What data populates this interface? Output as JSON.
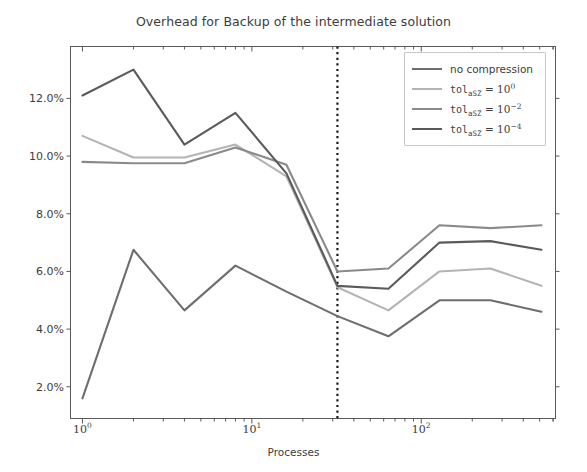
{
  "chart_data": {
    "type": "line",
    "title": "Overhead for Backup of the intermediate solution",
    "xlabel": "Processes",
    "ylabel": "",
    "xscale": "log",
    "yscale": "linear",
    "xlim": [
      0.85,
      620
    ],
    "ylim": [
      0.009,
      0.138
    ],
    "grid": false,
    "legend_position": "upper right",
    "xtick_labels": [
      "10^0",
      "10^1",
      "10^2"
    ],
    "xtick_values": [
      1,
      10,
      100
    ],
    "ytick_labels": [
      "2.0%",
      "4.0%",
      "6.0%",
      "8.0%",
      "10.0%",
      "12.0%"
    ],
    "ytick_values": [
      2.0,
      4.0,
      6.0,
      8.0,
      10.0,
      12.0
    ],
    "x": [
      1,
      2,
      4,
      8,
      16,
      32,
      64,
      128,
      256,
      512
    ],
    "annotations": [
      {
        "type": "vline",
        "x": 32,
        "style": "dotted",
        "color": "#1a1a1a"
      }
    ],
    "series": [
      {
        "name": "no compression",
        "label_plain": "no compression",
        "color": "#6e6e6e",
        "values": [
          1.6,
          6.75,
          4.65,
          6.2,
          5.3,
          4.45,
          3.75,
          5.0,
          5.0,
          4.6
        ]
      },
      {
        "name": "tol_aSZ = 10^0",
        "label_prefix": "tol",
        "label_sub": "aSZ",
        "label_eq": "=",
        "label_base": "10",
        "label_exp": "0",
        "color": "#b4b4b4",
        "values": [
          10.7,
          9.95,
          9.95,
          10.4,
          9.3,
          5.45,
          4.65,
          6.0,
          6.1,
          5.5
        ]
      },
      {
        "name": "tol_aSZ = 10^-2",
        "label_prefix": "tol",
        "label_sub": "aSZ",
        "label_eq": "=",
        "label_base": "10",
        "label_exp": "−2",
        "color": "#8a8a8a",
        "values": [
          9.8,
          9.75,
          9.75,
          10.3,
          9.7,
          6.0,
          6.1,
          7.6,
          7.5,
          7.6
        ]
      },
      {
        "name": "tol_aSZ = 10^-4",
        "label_prefix": "tol",
        "label_sub": "aSZ",
        "label_eq": "=",
        "label_base": "10",
        "label_exp": "−4",
        "color": "#5a5a5a",
        "values": [
          12.1,
          13.0,
          10.4,
          11.5,
          9.4,
          5.5,
          5.4,
          7.0,
          7.05,
          6.75
        ]
      }
    ]
  },
  "legend": {
    "entries": [
      {
        "text": "no compression"
      },
      {
        "text": "tol_aSZ = 10^0"
      },
      {
        "text": "tol_aSZ = 10^-2"
      },
      {
        "text": "tol_aSZ = 10^-4"
      }
    ]
  }
}
